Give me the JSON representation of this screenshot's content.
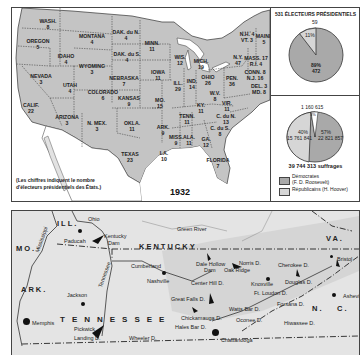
{
  "top_map": {
    "year": "1932",
    "note_line1": "(Les chiffres indiquent le nombre",
    "note_line2": "d'électeurs présidentiels des États.)",
    "states": [
      {
        "name": "WASH.",
        "votes": "8",
        "x": 36,
        "y": 11
      },
      {
        "name": "OREGON",
        "votes": "5",
        "x": 26,
        "y": 31
      },
      {
        "name": "IDAHO",
        "votes": "4",
        "x": 54,
        "y": 46
      },
      {
        "name": "MONTANA",
        "votes": "4",
        "x": 80,
        "y": 26
      },
      {
        "name": "DAK. du N.",
        "votes": "4",
        "x": 114,
        "y": 22
      },
      {
        "name": "DAK. du S.",
        "votes": "4",
        "x": 115,
        "y": 44
      },
      {
        "name": "MINN.",
        "votes": "11",
        "x": 140,
        "y": 33
      },
      {
        "name": "WIS.",
        "votes": "12",
        "x": 168,
        "y": 47
      },
      {
        "name": "WYOMING",
        "votes": "3",
        "x": 80,
        "y": 56
      },
      {
        "name": "NEBRASKA",
        "votes": "7",
        "x": 112,
        "y": 68
      },
      {
        "name": "IOWA",
        "votes": "11",
        "x": 146,
        "y": 62
      },
      {
        "name": "NEVADA",
        "votes": "3",
        "x": 29,
        "y": 66
      },
      {
        "name": "UTAH",
        "votes": "4",
        "x": 58,
        "y": 75
      },
      {
        "name": "COLORADO",
        "votes": "6",
        "x": 91,
        "y": 82
      },
      {
        "name": "KANSAS",
        "votes": "9",
        "x": 117,
        "y": 88
      },
      {
        "name": "MO.",
        "votes": "15",
        "x": 148,
        "y": 90
      },
      {
        "name": "ILL.",
        "votes": "29",
        "x": 166,
        "y": 73
      },
      {
        "name": "IND.",
        "votes": "14",
        "x": 180,
        "y": 71
      },
      {
        "name": "OHIO",
        "votes": "26",
        "x": 196,
        "y": 67
      },
      {
        "name": "MICH.",
        "votes": "19",
        "x": 189,
        "y": 51
      },
      {
        "name": "CALIF.",
        "votes": "22",
        "x": 19,
        "y": 95
      },
      {
        "name": "ARIZONA",
        "votes": "3",
        "x": 55,
        "y": 107
      },
      {
        "name": "N. MEX.",
        "votes": "3",
        "x": 85,
        "y": 113
      },
      {
        "name": "OKLA.",
        "votes": "11",
        "x": 120,
        "y": 113
      },
      {
        "name": "ARK.",
        "votes": "9",
        "x": 151,
        "y": 117
      },
      {
        "name": "TEXAS",
        "votes": "23",
        "x": 118,
        "y": 144
      },
      {
        "name": "LA.",
        "votes": "10",
        "x": 152,
        "y": 143
      },
      {
        "name": "MISS.",
        "votes": "9",
        "x": 164,
        "y": 127
      },
      {
        "name": "ALA.",
        "votes": "11",
        "x": 177,
        "y": 127
      },
      {
        "name": "GA.",
        "votes": "12",
        "x": 194,
        "y": 129
      },
      {
        "name": "FLORIDA",
        "votes": "7",
        "x": 206,
        "y": 150
      },
      {
        "name": "TENN.",
        "votes": "11",
        "x": 175,
        "y": 106
      },
      {
        "name": "KY.",
        "votes": "11",
        "x": 189,
        "y": 95
      },
      {
        "name": "C. du S.",
        "votes": "8",
        "x": 208,
        "y": 118
      },
      {
        "name": "C. du N.",
        "votes": "13",
        "x": 214,
        "y": 106
      },
      {
        "name": "VIR.",
        "votes": "11",
        "x": 215,
        "y": 93
      },
      {
        "name": "W.V.",
        "votes": "8",
        "x": 203,
        "y": 83
      },
      {
        "name": "PEN.",
        "votes": "36",
        "x": 220,
        "y": 68
      },
      {
        "name": "N.Y.",
        "votes": "47",
        "x": 226,
        "y": 47
      },
      {
        "name": "N.H. 4",
        "votes": "VT. 3",
        "x": 235,
        "y": 24
      },
      {
        "name": "MAINE",
        "votes": "5",
        "x": 252,
        "y": 26
      },
      {
        "name": "MASS. 17",
        "votes": "R.I. 4",
        "x": 244,
        "y": 48
      },
      {
        "name": "CONN. 8",
        "votes": "N.J. 16",
        "x": 243,
        "y": 62
      },
      {
        "name": "DEL. 3",
        "votes": "MD. 8",
        "x": 247,
        "y": 76
      }
    ]
  },
  "electoral_panel": {
    "title": "531 ÉLECTEURS PRÉSIDENTIELS",
    "dem_label": "89%",
    "dem_value": "472",
    "rep_label": "11%",
    "rep_value": "59"
  },
  "popular_panel": {
    "other_value": "1 160 615",
    "other_label": "3%",
    "rep_label": "40%",
    "rep_value": "15 761 841",
    "dem_label": "57%",
    "dem_value": "22 821 857",
    "total": "39 744 313 suffrages"
  },
  "legend": [
    {
      "label_line1": "Démocrates",
      "label_line2": "(F. D. Roosevelt)",
      "color": "#a9a9a9"
    },
    {
      "label_line1": "Républicains (H. Hoover)",
      "label_line2": "",
      "color": "#d6d6d6"
    }
  ],
  "colors": {
    "dem": "#a9a9a9",
    "rep": "#d6d6d6",
    "land": "#c4c4c4",
    "ink": "#222222"
  },
  "chart_data": [
    {
      "type": "pie",
      "title": "531 ÉLECTEURS PRÉSIDENTIELS",
      "categories": [
        "Démocrates (F. D. Roosevelt)",
        "Républicains (H. Hoover)"
      ],
      "values": [
        472,
        59
      ],
      "percent": [
        89,
        11
      ]
    },
    {
      "type": "pie",
      "title": "39 744 313 suffrages",
      "categories": [
        "Démocrates (F. D. Roosevelt)",
        "Républicains (H. Hoover)",
        "Autres"
      ],
      "values": [
        22821857,
        15761841,
        1160615
      ],
      "percent": [
        57,
        40,
        3
      ]
    }
  ],
  "tva_map": {
    "labels": [
      {
        "text": "ILL.",
        "x": 45,
        "y": 8,
        "cls": "big"
      },
      {
        "text": "Ohio",
        "x": 76,
        "y": 5,
        "cls": ""
      },
      {
        "text": "Green River",
        "x": 165,
        "y": 15,
        "cls": ""
      },
      {
        "text": "VA.",
        "x": 314,
        "y": 23,
        "cls": "big"
      },
      {
        "text": "MO.",
        "x": 4,
        "y": 33,
        "cls": "big"
      },
      {
        "text": "Paducah",
        "x": 52,
        "y": 27,
        "cls": ""
      },
      {
        "text": "Kentucky",
        "x": 92,
        "y": 22,
        "cls": ""
      },
      {
        "text": "Dam",
        "x": 96,
        "y": 29,
        "cls": ""
      },
      {
        "text": "KENTUCKY",
        "x": 127,
        "y": 31,
        "cls": "big"
      },
      {
        "text": "Bristol",
        "x": 325,
        "y": 45,
        "cls": ""
      },
      {
        "text": "Cumberland",
        "x": 119,
        "y": 52,
        "cls": ""
      },
      {
        "text": "Dale Hollow",
        "x": 184,
        "y": 50,
        "cls": ""
      },
      {
        "text": "Dam",
        "x": 192,
        "y": 56,
        "cls": ""
      },
      {
        "text": "Norris D.",
        "x": 227,
        "y": 49,
        "cls": ""
      },
      {
        "text": "Cherokee D.",
        "x": 266,
        "y": 51,
        "cls": ""
      },
      {
        "text": "Oak Ridge",
        "x": 212,
        "y": 56,
        "cls": ""
      },
      {
        "text": "Nashville",
        "x": 135,
        "y": 67,
        "cls": ""
      },
      {
        "text": "Center Hill D.",
        "x": 179,
        "y": 69,
        "cls": ""
      },
      {
        "text": "Knoxville",
        "x": 239,
        "y": 70,
        "cls": ""
      },
      {
        "text": "Douglas D.",
        "x": 273,
        "y": 68,
        "cls": ""
      },
      {
        "text": "Jackson",
        "x": 55,
        "y": 81,
        "cls": ""
      },
      {
        "text": "Great Falls D.",
        "x": 159,
        "y": 85,
        "cls": ""
      },
      {
        "text": "Ft. Loudon D.",
        "x": 242,
        "y": 79,
        "cls": ""
      },
      {
        "text": "Asheville",
        "x": 331,
        "y": 82,
        "cls": ""
      },
      {
        "text": "Fontana D.",
        "x": 265,
        "y": 90,
        "cls": ""
      },
      {
        "text": "N.",
        "x": 300,
        "y": 93,
        "cls": "big"
      },
      {
        "text": "C.",
        "x": 325,
        "y": 93,
        "cls": "big"
      },
      {
        "text": "Memphis",
        "x": 20,
        "y": 109,
        "cls": ""
      },
      {
        "text": "TENNESSEE",
        "x": 48,
        "y": 104,
        "cls": "huge"
      },
      {
        "text": "Chickamauga D.",
        "x": 169,
        "y": 104,
        "cls": ""
      },
      {
        "text": "Watts Bar D.",
        "x": 217,
        "y": 95,
        "cls": ""
      },
      {
        "text": "Oconee D.",
        "x": 224,
        "y": 106,
        "cls": ""
      },
      {
        "text": "Hiwassee D.",
        "x": 272,
        "y": 109,
        "cls": ""
      },
      {
        "text": "Pickwick",
        "x": 62,
        "y": 115,
        "cls": ""
      },
      {
        "text": "Hales Bar D.",
        "x": 163,
        "y": 113,
        "cls": ""
      },
      {
        "text": "Landing D.",
        "x": 62,
        "y": 124,
        "cls": ""
      },
      {
        "text": "Wheeler D.",
        "x": 117,
        "y": 124,
        "cls": ""
      },
      {
        "text": "Chattanooga",
        "x": 209,
        "y": 126,
        "cls": ""
      },
      {
        "text": "ARK.",
        "x": 9,
        "y": 74,
        "cls": "big"
      },
      {
        "text": "Mississippi",
        "x": 22,
        "y": 40,
        "cls": ""
      },
      {
        "text": "Tennessee",
        "x": 85,
        "y": 75,
        "cls": ""
      }
    ]
  }
}
